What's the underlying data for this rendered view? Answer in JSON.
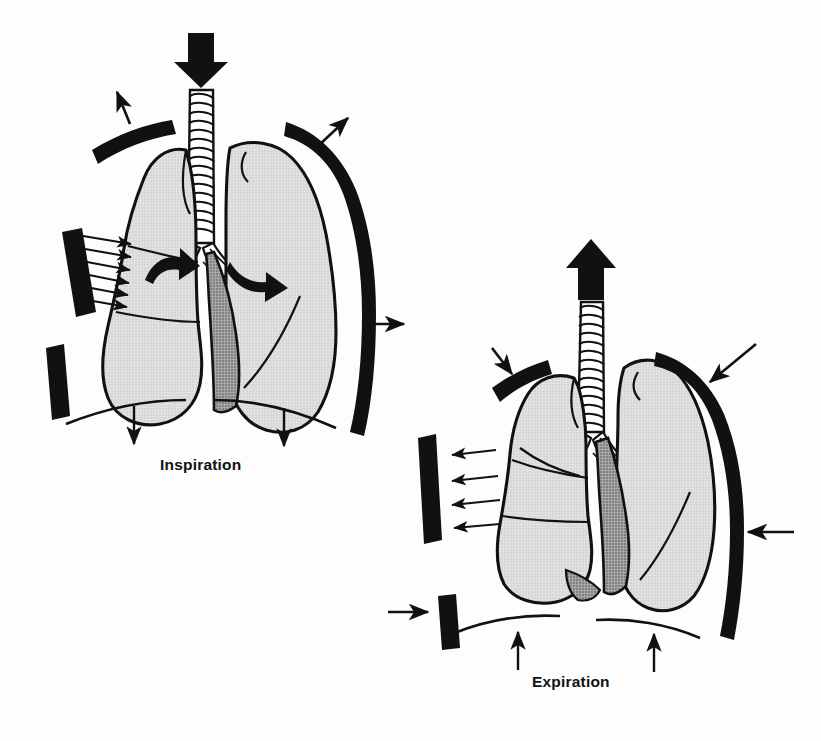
{
  "figure": {
    "background_color": "#fdfdfd",
    "ink_color": "#111111",
    "lung_fill_color": "#d9d9d9",
    "mediastinum_fill_color": "#9a9a9a",
    "panels": [
      {
        "id": "inspiration",
        "label": "Inspiration",
        "label_position": {
          "x": 160,
          "y": 456
        },
        "airflow_direction": "in",
        "airflow_arrow": "down-arrow-into-trachea",
        "rib_motion": "up-and-out",
        "diaphragm_motion": "down",
        "chest_wall_arrows": "outward",
        "hilar_arrows": "outward-curved"
      },
      {
        "id": "expiration",
        "label": "Expiration",
        "label_position": {
          "x": 532,
          "y": 673
        },
        "airflow_direction": "out",
        "airflow_arrow": "up-arrow-out-of-trachea",
        "rib_motion": "down-and-in",
        "diaphragm_motion": "up",
        "chest_wall_arrows": "inward",
        "hilar_arrows": "none"
      }
    ],
    "anatomy_labels": [
      "trachea",
      "main-bronchus-left",
      "main-bronchus-right",
      "lung-left",
      "lung-right",
      "rib",
      "diaphragm",
      "mediastinum"
    ]
  }
}
